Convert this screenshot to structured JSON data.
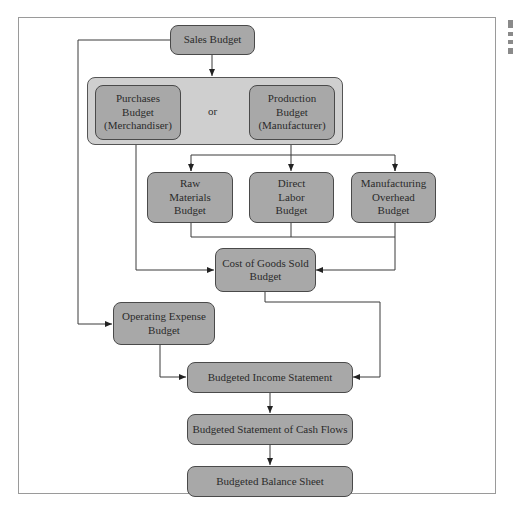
{
  "diagram": {
    "nodes": {
      "sales": "Sales Budget",
      "purchases": [
        "Purchases",
        "Budget",
        "(Merchandiser)"
      ],
      "or_label": "or",
      "production": [
        "Production",
        "Budget",
        "(Manufacturer)"
      ],
      "raw_materials": [
        "Raw",
        "Materials",
        "Budget"
      ],
      "direct_labor": [
        "Direct",
        "Labor",
        "Budget"
      ],
      "mfg_overhead": [
        "Manufacturing",
        "Overhead",
        "Budget"
      ],
      "cogs": [
        "Cost of Goods Sold",
        "Budget"
      ],
      "operating_expense": [
        "Operating Expense",
        "Budget"
      ],
      "income_statement": "Budgeted Income Statement",
      "cash_flows": "Budgeted Statement of Cash Flows",
      "balance_sheet": "Budgeted Balance Sheet"
    },
    "edges": [
      [
        "Sales Budget",
        "Purchases/Production group"
      ],
      [
        "Sales Budget",
        "Operating Expense Budget"
      ],
      [
        "Production Budget",
        "Raw Materials Budget"
      ],
      [
        "Production Budget",
        "Direct Labor Budget"
      ],
      [
        "Production Budget",
        "Manufacturing Overhead Budget"
      ],
      [
        "Raw Materials / Direct Labor / Manufacturing Overhead",
        "Cost of Goods Sold Budget"
      ],
      [
        "Purchases Budget",
        "Cost of Goods Sold Budget"
      ],
      [
        "Cost of Goods Sold Budget",
        "Budgeted Income Statement"
      ],
      [
        "Operating Expense Budget",
        "Budgeted Income Statement"
      ],
      [
        "Budgeted Income Statement",
        "Budgeted Statement of Cash Flows"
      ],
      [
        "Budgeted Statement of Cash Flows",
        "Budgeted Balance Sheet"
      ]
    ],
    "colors": {
      "box_fill": "#a8a8a8",
      "group_fill": "#cfcfcf",
      "line": "#3a3a3a",
      "frame": "#9a9a9a"
    }
  }
}
